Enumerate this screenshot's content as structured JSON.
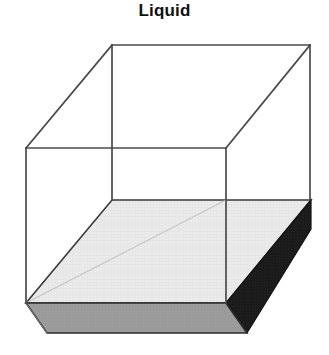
{
  "figure": {
    "title": "Liquid",
    "kind": "3d-box-liquid-fill-diagram",
    "canvas": {
      "width": 329,
      "height": 355,
      "background": "#ffffff"
    },
    "colors": {
      "background": "#ffffff",
      "container_edge": "#4a4a4a",
      "liquid_surface_fill": "#e9e9e9",
      "liquid_surface_edge": "#3a3a3a",
      "liquid_front_fill": "#9c9c9c",
      "liquid_front_edge": "#2b2b2b",
      "liquid_side_fill": "#1a1a1a",
      "liquid_side_edge": "#111111",
      "hidden_edge": "#bdbdbd",
      "title_text": "#111111"
    },
    "geometry": {
      "box": {
        "back_top_left": [
          112,
          45
        ],
        "back_top_right": [
          310,
          45
        ],
        "front_top_left": [
          26,
          148
        ],
        "front_top_right": [
          226,
          148
        ],
        "back_bottom_left": [
          112,
          200
        ],
        "back_bottom_right": [
          310,
          200
        ],
        "front_bottom_left": [
          26,
          303
        ],
        "front_bottom_right": [
          226,
          303
        ]
      },
      "liquid": {
        "surface_back_left": [
          112,
          200
        ],
        "surface_back_right": [
          311,
          200
        ],
        "surface_front_right": [
          226,
          303
        ],
        "surface_front_left": [
          26,
          303
        ],
        "front_bottom_left": [
          26,
          334
        ],
        "front_bottom_right": [
          226,
          334
        ],
        "side_bottom_right": [
          247,
          333
        ],
        "side_top_right": [
          311,
          228
        ],
        "fill_depth_px": 31,
        "fill_level_from_top": "about 60 percent of box height empty"
      },
      "hidden_interior_edge": {
        "from": [
          26,
          303
        ],
        "to": [
          226,
          200
        ]
      }
    },
    "labels": {
      "title": "Liquid"
    }
  }
}
